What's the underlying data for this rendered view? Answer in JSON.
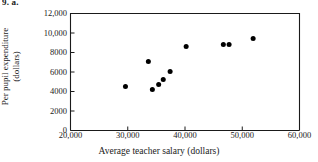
{
  "problem": {
    "label": "9. a."
  },
  "chart_data": {
    "type": "scatter",
    "title": "",
    "xlabel": "Average teacher salary (dollars)",
    "ylabel_line1": "Per pupil expenditure",
    "ylabel_line2": "(dollars)",
    "xlim": [
      20000,
      60000
    ],
    "ylim": [
      0,
      12000
    ],
    "xticks": [
      20000,
      30000,
      40000,
      50000,
      60000
    ],
    "xtick_labels": [
      "20,000",
      "30,000",
      "40,000",
      "50,000",
      "60,000"
    ],
    "yticks": [
      0,
      2000,
      4000,
      6000,
      8000,
      10000,
      12000
    ],
    "ytick_labels": [
      "0",
      "2000",
      "4000",
      "6000",
      "8000",
      "10,000",
      "12,000"
    ],
    "grid": false,
    "legend": false,
    "marker": "filled-circle",
    "marker_color": "#000000",
    "marker_size_px": 5,
    "axis_color": "#1a1a1a",
    "background": "#ffffff",
    "points": [
      {
        "x": 29600,
        "y": 4510
      },
      {
        "x": 33600,
        "y": 7080
      },
      {
        "x": 34300,
        "y": 4200
      },
      {
        "x": 35400,
        "y": 4720
      },
      {
        "x": 36200,
        "y": 5230
      },
      {
        "x": 37400,
        "y": 6050
      },
      {
        "x": 40200,
        "y": 8620
      },
      {
        "x": 46700,
        "y": 8820
      },
      {
        "x": 47700,
        "y": 8820
      },
      {
        "x": 51900,
        "y": 9440
      }
    ]
  }
}
